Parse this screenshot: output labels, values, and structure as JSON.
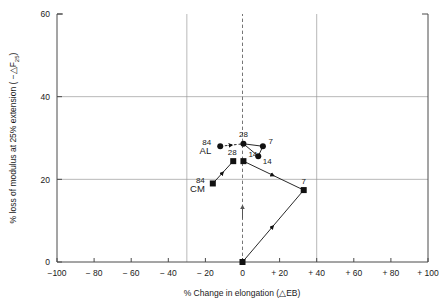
{
  "chart_data": {
    "type": "scatter",
    "title": "",
    "xlabel": "% Change in elongation    (△EB)",
    "ylabel": "% loss of modulus at 25% extension   ( −△F",
    "ylabel_sub": "25",
    "ylabel_tail": ")",
    "xlim": [
      -100,
      100
    ],
    "ylim": [
      0,
      60
    ],
    "xticks": [
      -100,
      -80,
      -60,
      -40,
      -20,
      0,
      20,
      40,
      60,
      80,
      100
    ],
    "xticklabels": [
      "−100",
      "− 80",
      "− 60",
      "− 40",
      "− 20",
      "0",
      "+ 20",
      "+ 40",
      "+ 60",
      "+ 80",
      "+ 100"
    ],
    "yticks": [
      0,
      20,
      40,
      60
    ],
    "yticklabels": [
      "0",
      "20",
      "40",
      "60"
    ],
    "grid": true,
    "gridlines_x": [
      -30,
      40
    ],
    "gridlines_y": [
      20,
      40
    ],
    "reference_line": {
      "x": 0,
      "style": "dashed",
      "arrow": "up"
    },
    "series": [
      {
        "name": "AL",
        "label": "AL",
        "group_label": "84",
        "marker": "circle",
        "color": "#111111",
        "points": [
          {
            "label": "84",
            "x": -12.0,
            "y": 28.0
          },
          {
            "label": "28",
            "x": 0.5,
            "y": 28.6
          },
          {
            "label": "7",
            "x": 11.0,
            "y": 28.0
          },
          {
            "label": "14",
            "x": 8.5,
            "y": 25.6
          }
        ]
      },
      {
        "name": "CM",
        "label": "CM",
        "group_label": "84",
        "marker": "square",
        "color": "#111111",
        "points": [
          {
            "label": "84",
            "x": -16.0,
            "y": 19.0
          },
          {
            "label": "28",
            "x": -5.0,
            "y": 24.4
          },
          {
            "label": "14",
            "x": 0.5,
            "y": 24.4
          },
          {
            "label": "7",
            "x": 33.0,
            "y": 17.4
          },
          {
            "label": "",
            "x": 0.0,
            "y": 0.0
          }
        ]
      }
    ],
    "connectors": [
      {
        "series": "AL",
        "from": [
          -12.0,
          28.0
        ],
        "to": [
          0.5,
          28.6
        ],
        "arrow": true
      },
      {
        "series": "AL",
        "from": [
          0.5,
          28.6
        ],
        "to": [
          11.0,
          28.0
        ],
        "arrow": false
      },
      {
        "series": "AL",
        "from": [
          0.5,
          28.6
        ],
        "to": [
          8.5,
          25.6
        ],
        "arrow": false
      },
      {
        "series": "AL",
        "from": [
          11.0,
          28.0
        ],
        "to": [
          8.5,
          25.6
        ],
        "arrow": false
      },
      {
        "series": "CM",
        "from": [
          -16.0,
          19.0
        ],
        "to": [
          -5.0,
          24.4
        ],
        "arrow": true
      },
      {
        "series": "CM",
        "from": [
          0.5,
          24.4
        ],
        "to": [
          33.0,
          17.4
        ],
        "arrow": true
      },
      {
        "series": "CM",
        "from": [
          0.0,
          0.0
        ],
        "to": [
          33.0,
          17.4
        ],
        "arrow": true
      }
    ]
  }
}
